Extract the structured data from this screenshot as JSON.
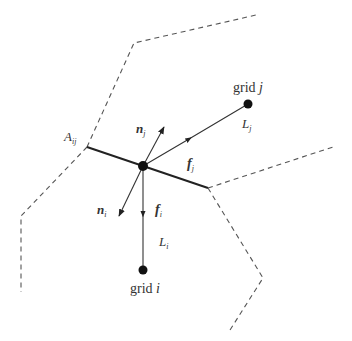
{
  "figure": {
    "colors": {
      "line": "#222222",
      "dash": "#555555",
      "text": "#333333",
      "node": "#111111"
    },
    "nodes": {
      "center": {
        "x": 143,
        "y": 166
      },
      "grid_j": {
        "x": 248,
        "y": 104,
        "label": "grid",
        "index": "j"
      },
      "grid_i": {
        "x": 143,
        "y": 270,
        "label": "grid",
        "index": "i"
      }
    },
    "labels": {
      "area": {
        "base": "A",
        "sub": "ij"
      },
      "n_j": {
        "base": "n",
        "sub": "j"
      },
      "n_i": {
        "base": "n",
        "sub": "i"
      },
      "f_j": {
        "base": "f",
        "sub": "j"
      },
      "f_i": {
        "base": "f",
        "sub": "i"
      },
      "L_j": {
        "base": "L",
        "sub": "j"
      },
      "L_i": {
        "base": "L",
        "sub": "i"
      },
      "grid_j": {
        "base": "grid ",
        "sub_inline": "j"
      },
      "grid_i": {
        "base": "grid ",
        "sub_inline": "i"
      }
    }
  }
}
